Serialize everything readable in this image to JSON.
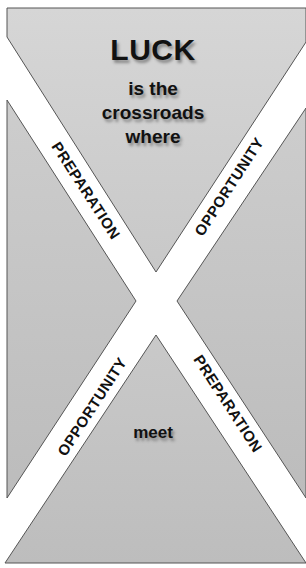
{
  "poster": {
    "headline": "LUCK",
    "line1": "is the",
    "line2": "crossroads",
    "line3": "where",
    "bottom_word": "meet"
  },
  "strips": {
    "top_left": "PREPARATION",
    "top_right": "OPPORTUNITY",
    "bottom_left": "OPPORTUNITY",
    "bottom_right": "PREPARATION"
  },
  "colors": {
    "panel_fill": "#c6c6c6",
    "panel_fill_light": "#d8d8d8",
    "strip_fill": "#ffffff",
    "text": "#111111",
    "border": "#555555"
  }
}
